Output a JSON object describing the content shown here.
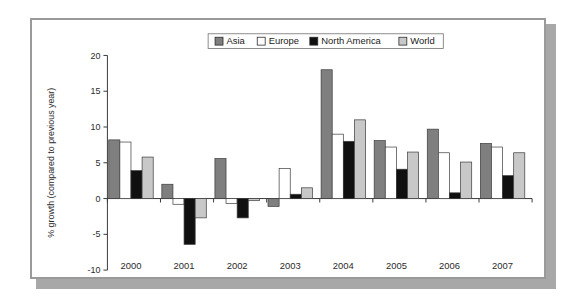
{
  "chart_data": {
    "type": "bar",
    "title": "",
    "subtitle": "",
    "xlabel": "",
    "ylabel": "% growth (compared to previous year)",
    "categories": [
      "2000",
      "2001",
      "2002",
      "2003",
      "2004",
      "2005",
      "2006",
      "2007"
    ],
    "ylim": [
      -10,
      20
    ],
    "yticks": [
      -10,
      -5,
      0,
      5,
      10,
      15,
      20
    ],
    "ytick_labels": [
      "-10",
      "-5",
      "0",
      "5",
      "10",
      "15",
      "20"
    ],
    "grid": false,
    "legend_position": "top-center",
    "zero_line": true,
    "series": [
      {
        "name": "Asia",
        "color": "#7f7f7f",
        "values": [
          8.2,
          2.0,
          5.6,
          -1.1,
          18.0,
          8.1,
          9.7,
          7.7
        ]
      },
      {
        "name": "Europe",
        "color": "#ffffff",
        "values": [
          7.9,
          -0.8,
          -0.7,
          4.2,
          9.0,
          7.2,
          6.4,
          7.2
        ]
      },
      {
        "name": "North America",
        "color": "#101010",
        "values": [
          3.9,
          -6.4,
          -2.7,
          0.6,
          8.0,
          4.1,
          0.8,
          3.2
        ]
      },
      {
        "name": "World",
        "color": "#c8c8c8",
        "values": [
          5.8,
          -2.7,
          -0.3,
          1.5,
          11.0,
          6.5,
          5.1,
          6.4
        ]
      }
    ]
  },
  "legend": {
    "items": [
      {
        "label": "Asia",
        "swatch": "#7f7f7f"
      },
      {
        "label": "Europe",
        "swatch": "#ffffff"
      },
      {
        "label": "North America",
        "swatch": "#101010"
      },
      {
        "label": "World",
        "swatch": "#c8c8c8"
      }
    ]
  },
  "colors": {
    "frame_border": "#9a9a9a",
    "shadow": "#a8a8a8",
    "axis": "#3a3a3a",
    "text": "#2b2b2b",
    "background": "#ffffff"
  }
}
